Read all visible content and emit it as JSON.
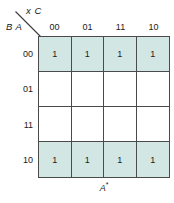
{
  "diagram": {
    "kind": "karnaugh-map",
    "top_variables_label": "x C",
    "side_variables_label": "B A",
    "bottom_label_base": "A",
    "bottom_label_superscript": "*",
    "colors": {
      "cell_fill": "#d2e6e4",
      "grid_line": "#4a4a4a",
      "text": "#1b1b1b",
      "background": "#ffffff"
    },
    "column_headers": [
      "00",
      "01",
      "11",
      "10"
    ],
    "row_headers": [
      "00",
      "01",
      "11",
      "10"
    ],
    "cells": [
      [
        {
          "value": "1",
          "filled": true
        },
        {
          "value": "1",
          "filled": true
        },
        {
          "value": "1",
          "filled": true
        },
        {
          "value": "1",
          "filled": true
        }
      ],
      [
        {
          "value": "",
          "filled": false
        },
        {
          "value": "",
          "filled": false
        },
        {
          "value": "",
          "filled": false
        },
        {
          "value": "",
          "filled": false
        }
      ],
      [
        {
          "value": "",
          "filled": false
        },
        {
          "value": "",
          "filled": false
        },
        {
          "value": "",
          "filled": false
        },
        {
          "value": "",
          "filled": false
        }
      ],
      [
        {
          "value": "1",
          "filled": true
        },
        {
          "value": "1",
          "filled": true
        },
        {
          "value": "1",
          "filled": true
        },
        {
          "value": "1",
          "filled": true
        }
      ]
    ]
  }
}
